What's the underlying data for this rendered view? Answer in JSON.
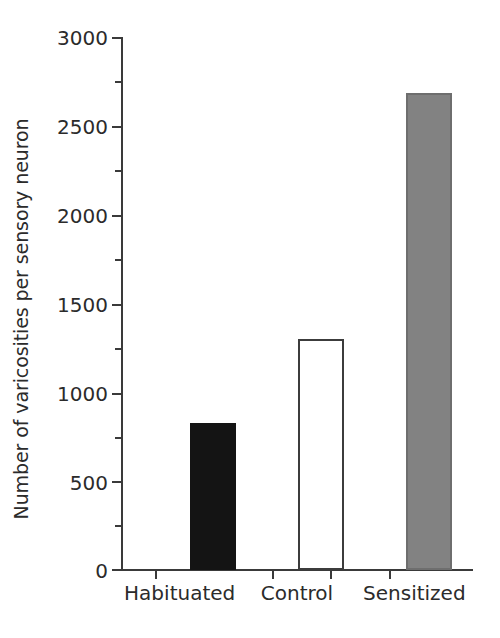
{
  "chart_data": {
    "type": "bar",
    "title": "",
    "xlabel": "",
    "ylabel": "Number of varicosities per sensory neuron",
    "categories": [
      "Habituated",
      "Control",
      "Sensitized"
    ],
    "values": [
      830,
      1300,
      2690
    ],
    "series": [
      {
        "name": "Number of varicosities per sensory neuron",
        "values": [
          830,
          1300,
          2690
        ]
      }
    ],
    "bar_colors": [
      "#141414",
      "#ffffff",
      "#828282"
    ],
    "bar_edge_colors": [
      "#141414",
      "#3c3c3c",
      "#6e6e6e"
    ],
    "ylim": [
      0,
      3000
    ],
    "y_major_ticks": [
      0,
      500,
      1000,
      1500,
      2000,
      2500,
      3000
    ],
    "y_minor_ticks": [
      250,
      750,
      1250,
      1750,
      2250,
      2750
    ],
    "y_tick_labels": [
      "0",
      "500",
      "1000",
      "1500",
      "2000",
      "2500",
      "3000"
    ],
    "grid": false,
    "legend": null,
    "legend_position": "none",
    "tick_direction": "out",
    "spines": [
      "left",
      "bottom"
    ]
  },
  "axis": {
    "y_title": "Number of varicosities per sensory neuron",
    "tick_3000": "3000",
    "tick_2500": "2500",
    "tick_2000": "2000",
    "tick_1500": "1500",
    "tick_1000": "1000",
    "tick_500": "500",
    "tick_0": "0"
  },
  "categories": {
    "habituated": "Habituated",
    "control": "Control",
    "sensitized": "Sensitized"
  },
  "colors": {
    "axis": "#3a3a3a",
    "text": "#2b2b2b",
    "bar_black": "#141414",
    "bar_white": "#ffffff",
    "bar_gray": "#828282",
    "background": "#ffffff"
  }
}
